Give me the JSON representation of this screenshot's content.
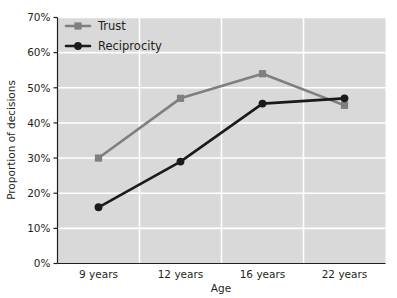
{
  "chart_data": {
    "type": "line",
    "title": "",
    "xlabel": "Age",
    "ylabel": "Proportion of decisions",
    "categories": [
      "9 years",
      "12 years",
      "16 years",
      "22 years"
    ],
    "ytick_labels": [
      "0%",
      "10%",
      "20%",
      "30%",
      "40%",
      "50%",
      "60%",
      "70%"
    ],
    "ytick_values": [
      0,
      10,
      20,
      30,
      40,
      50,
      60,
      70
    ],
    "ylim": [
      0,
      70
    ],
    "grid": "horizontal-and-vertical",
    "legend_position": "top-left-inside",
    "plot_background": "#d9d9d9",
    "gridline_color": "#ffffff",
    "series": [
      {
        "name": "Trust",
        "color": "#7f7f7f",
        "marker": "square",
        "values": [
          30,
          47,
          54,
          45
        ]
      },
      {
        "name": "Reciprocity",
        "color": "#1a1a1a",
        "marker": "circle",
        "values": [
          16,
          29,
          45.5,
          47
        ]
      }
    ]
  }
}
